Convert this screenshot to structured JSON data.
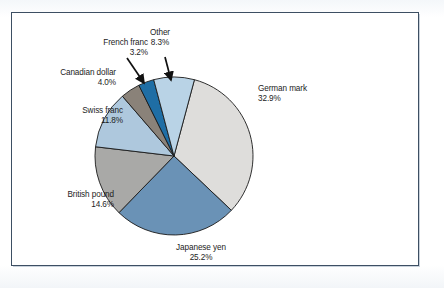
{
  "figure": {
    "background_color": "#ffffff",
    "frame_color": "#3d4f63",
    "label_color": "#1c1c1c"
  },
  "chart_data": {
    "type": "pie",
    "title": "",
    "subtitle": "",
    "xlabel": "",
    "ylabel": "",
    "legend_position": "callout-labels",
    "grid": false,
    "units": "percent",
    "total": 100.0,
    "categories": [
      "German mark",
      "Japanese yen",
      "British pound",
      "Swiss franc",
      "Canadian dollar",
      "French franc",
      "Other"
    ],
    "values": [
      32.9,
      25.2,
      14.6,
      11.8,
      4.0,
      3.2,
      8.3
    ],
    "colors": [
      "#dedddb",
      "#6a92b6",
      "#a9a9a7",
      "#aec8dd",
      "#8a8279",
      "#1f6ea5",
      "#b9d3e6"
    ],
    "slices": [
      {
        "label": "German mark",
        "value_label": "32.9%",
        "value": 32.9,
        "color": "#dedddb",
        "label_align": "left",
        "label_x": 258,
        "label_y": 84
      },
      {
        "label": "Japanese yen",
        "value_label": "25.2%",
        "value": 25.2,
        "color": "#6a92b6",
        "label_align": "center",
        "label_x": 201,
        "label_y": 243
      },
      {
        "label": "British pound",
        "value_label": "14.6%",
        "value": 14.6,
        "color": "#a9a9a7",
        "label_align": "right",
        "label_x": 28,
        "label_y": 190
      },
      {
        "label": "Swiss franc",
        "value_label": "11.8%",
        "value": 11.8,
        "color": "#aec8dd",
        "label_align": "right",
        "label_x": 37,
        "label_y": 106
      },
      {
        "label": "Canadian dollar",
        "value_label": "4.0%",
        "value": 4.0,
        "color": "#8a8279",
        "label_align": "right",
        "label_x": 30,
        "label_y": 68
      },
      {
        "label": "French franc",
        "value_label": "3.2%",
        "value": 3.2,
        "color": "#1f6ea5",
        "label_align": "right",
        "label_x": 62,
        "label_y": 38
      },
      {
        "label": "Other",
        "value_label": "8.3%",
        "value": 8.3,
        "color": "#b9d3e6",
        "label_align": "center",
        "label_x": 160,
        "label_y": 28
      }
    ],
    "annotations": [
      {
        "name": "arrow-to-french-franc",
        "from_x": 127,
        "from_y": 58,
        "to_x": 144,
        "to_y": 83
      },
      {
        "name": "arrow-to-other",
        "from_x": 165,
        "from_y": 57,
        "to_x": 171,
        "to_y": 80
      }
    ],
    "geometry": {
      "center_x": 174,
      "center_y": 156,
      "radius": 79,
      "start_angle_deg": -75,
      "direction": "clockwise",
      "outline_color": "#1a1a1a"
    }
  }
}
